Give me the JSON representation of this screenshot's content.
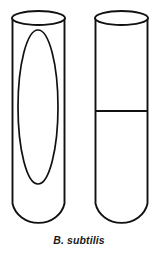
{
  "figure": {
    "caption": "B. subtilis",
    "background_color": "#ffffff",
    "line_color": "#111111",
    "width": 158,
    "height": 257,
    "cells": [
      {
        "id": "cell-left",
        "name": "sporulating-cell",
        "label": "",
        "x": 12,
        "y": 11,
        "width": 53,
        "height": 217,
        "top_cap": "open-ellipse",
        "bottom_cap": "rounded",
        "inclusion": {
          "name": "endospore",
          "shape": "ellipse",
          "cx": 38,
          "cy": 107,
          "rx": 20,
          "ry": 77
        }
      },
      {
        "id": "cell-right",
        "name": "dividing-cell",
        "label": "",
        "x": 95,
        "y": 11,
        "width": 53,
        "height": 217,
        "top_cap": "open-ellipse",
        "bottom_cap": "rounded",
        "divider": {
          "name": "septum",
          "shape": "horizontal-line",
          "y": 111
        }
      }
    ]
  }
}
